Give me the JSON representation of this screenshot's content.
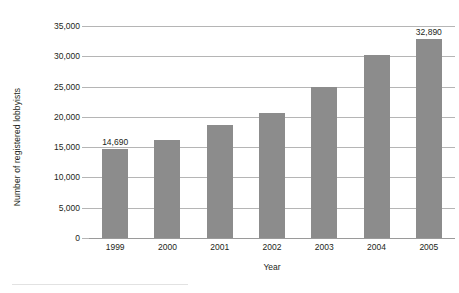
{
  "chart_data": {
    "type": "bar",
    "title": "",
    "subtitle": "",
    "xlabel": "Year",
    "ylabel": "Number of registered lobbyists",
    "categories": [
      "1999",
      "2000",
      "2001",
      "2002",
      "2003",
      "2004",
      "2005"
    ],
    "values": [
      14690,
      16100,
      18600,
      20600,
      24900,
      30200,
      32890
    ],
    "data_labels": [
      "14,690",
      "",
      "",
      "",
      "",
      "",
      "32,890"
    ],
    "ylim": [
      0,
      35000
    ],
    "ytick_values": [
      0,
      5000,
      10000,
      15000,
      20000,
      25000,
      30000,
      35000
    ],
    "ytick_labels": [
      "0",
      "5,000",
      "10,000",
      "15,000",
      "20,000",
      "25,000",
      "30,000",
      "35,000"
    ],
    "grid": true,
    "grid_axis": "y",
    "legend": false,
    "legend_position": "none",
    "bar_color": "#8c8c8c",
    "gridline_color": "#b5b5b5",
    "background_color": "#ffffff",
    "text_color": "#231f20"
  },
  "axes": {
    "y_title": "Number of registered lobbyists",
    "x_title": "Year"
  }
}
